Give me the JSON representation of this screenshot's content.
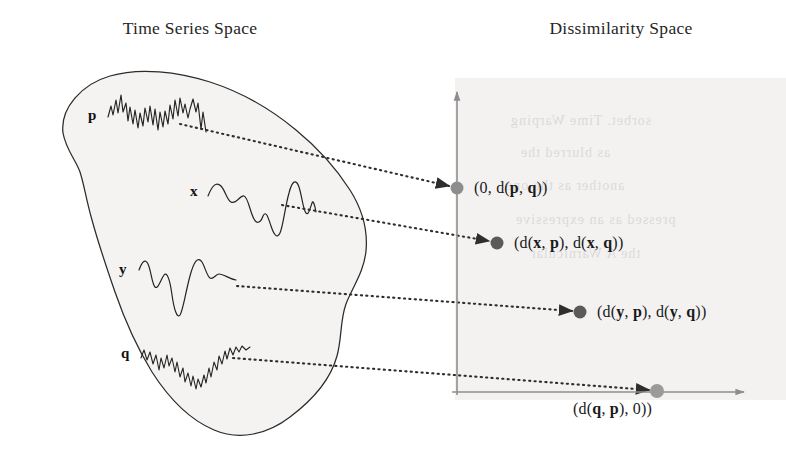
{
  "figure": {
    "width": 786,
    "height": 467,
    "background_color": "#ffffff"
  },
  "panels": {
    "left": {
      "title": "Time Series Space",
      "blob_fill": "#f4f3f2",
      "blob_stroke": "#2b2b2b",
      "series": [
        {
          "label": "p",
          "kind": "high-noise-waveform"
        },
        {
          "label": "x",
          "kind": "smooth-waveform"
        },
        {
          "label": "y",
          "kind": "smooth-waveform"
        },
        {
          "label": "q",
          "kind": "noisy-waveform"
        }
      ]
    },
    "right": {
      "title": "Dissimilarity Space",
      "plot_background": "#f2f1f0",
      "axis_color": "#8e8e8e",
      "points": [
        {
          "id": "point-p",
          "label_plain": "(0, d(p, q))",
          "label_html": "(0, d(<b>p</b>, <b>q</b>))",
          "x": 457,
          "y": 188,
          "color": "#8d8d8d",
          "radius": 6.5
        },
        {
          "id": "point-x",
          "label_plain": "(d(x, p), d(x, q))",
          "label_html": "(d(<b>x</b>, <b>p</b>), d(<b>x</b>, <b>q</b>))",
          "x": 497,
          "y": 243,
          "color": "#5a5a5a",
          "radius": 6.5
        },
        {
          "id": "point-y",
          "label_plain": "(d(y, p), d(y, q))",
          "label_html": "(d(<b>y</b>, <b>p</b>), d(<b>y</b>, <b>q</b>))",
          "x": 580,
          "y": 312,
          "color": "#5a5a5a",
          "radius": 6.5
        },
        {
          "id": "point-q",
          "label_plain": "(d(q, p), 0))",
          "label_html": "(d(<b>q</b>, <b>p</b>), 0))",
          "x": 657,
          "y": 391,
          "color": "#9a9a9a",
          "radius": 7
        }
      ]
    }
  },
  "mappings": [
    {
      "from_series": "p",
      "to_point": "point-p"
    },
    {
      "from_series": "x",
      "to_point": "point-x"
    },
    {
      "from_series": "y",
      "to_point": "point-y"
    },
    {
      "from_series": "q",
      "to_point": "point-q"
    }
  ],
  "bleed_through_text": [
    "sorbet. Time Warping",
    "as blurred the",
    "another as the one",
    "pressed as an expressive",
    "the A Warnicular"
  ]
}
